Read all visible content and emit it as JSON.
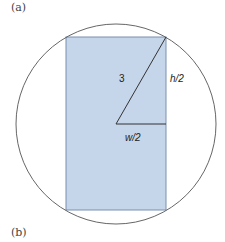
{
  "panels": {
    "top_label": "(a)",
    "bottom_label": "(b)"
  },
  "diagram": {
    "circle": {
      "cx": 116,
      "cy": 124,
      "r": 100,
      "stroke": "#555555"
    },
    "rectangle": {
      "x": 66,
      "y": 37,
      "width": 100,
      "height": 173,
      "fill": "#c5d5ea",
      "stroke": "#7a90b0"
    },
    "labels": {
      "radius": "3",
      "half_height": "h/2",
      "half_width": "w/2"
    }
  }
}
